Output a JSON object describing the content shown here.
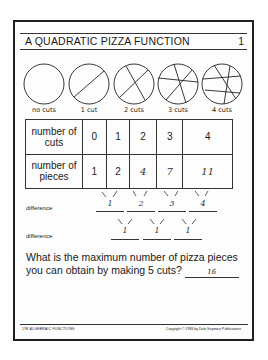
{
  "header": {
    "title": "A QUADRATIC PIZZA FUNCTION",
    "page_number": "1"
  },
  "pizzas": [
    {
      "label": "no cuts",
      "cuts": 0
    },
    {
      "label": "1 cut",
      "cuts": 1
    },
    {
      "label": "2 cuts",
      "cuts": 2
    },
    {
      "label": "3 cuts",
      "cuts": 3
    },
    {
      "label": "4 cuts",
      "cuts": 4
    }
  ],
  "table": {
    "row1_header_line1": "number of",
    "row1_header_line2": "cuts",
    "row2_header_line1": "number of",
    "row2_header_line2": "pieces",
    "cuts": [
      "0",
      "1",
      "2",
      "3",
      "4"
    ],
    "pieces": [
      "1",
      "2",
      "4",
      "7",
      "11"
    ]
  },
  "first_differences": {
    "label": "difference",
    "values": [
      "1",
      "2",
      "3",
      "4"
    ]
  },
  "second_differences": {
    "label": "difference",
    "values": [
      "1",
      "1",
      "1"
    ]
  },
  "question": {
    "text": "What is the maximum number of pizza pieces you can obtain by making 5 cuts?",
    "answer": "16"
  },
  "footer": {
    "left": "198  ALGEBRAIC FUNCTIONS",
    "right": "Copyright © 1983 by Dale Seymour Publications"
  }
}
